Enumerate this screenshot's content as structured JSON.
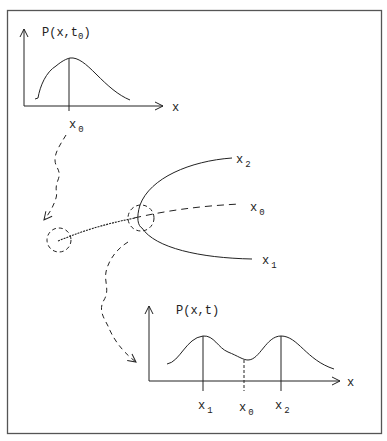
{
  "top_plot": {
    "y_label": "P(x,t",
    "y_label_sub": "0",
    "y_label_close": ")",
    "x_axis_label": "x",
    "marker": {
      "name": "x",
      "sub": "0"
    }
  },
  "trajectories": {
    "branch_upper": {
      "name": "x",
      "sub": "2"
    },
    "branch_middle": {
      "name": "x",
      "sub": "0"
    },
    "branch_lower": {
      "name": "x",
      "sub": "1"
    }
  },
  "bottom_plot": {
    "y_label": "P(x,t)",
    "x_axis_label": "x",
    "markers": [
      {
        "name": "x",
        "sub": "1"
      },
      {
        "name": "x",
        "sub": "0"
      },
      {
        "name": "x",
        "sub": "2"
      }
    ]
  }
}
